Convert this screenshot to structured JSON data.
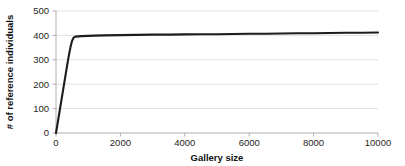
{
  "chart_data": {
    "type": "line",
    "title": "",
    "xlabel": "Gallery size",
    "ylabel": "# of reference individuals",
    "xlim": [
      0,
      10000
    ],
    "ylim": [
      0,
      500
    ],
    "xticks": [
      0,
      2000,
      4000,
      6000,
      8000,
      10000
    ],
    "xtick_labels": [
      "0",
      "2000",
      "4000",
      "6000",
      "8000",
      "10000"
    ],
    "yticks": [
      0,
      100,
      200,
      300,
      400,
      500
    ],
    "ytick_labels": [
      "0",
      "100",
      "200",
      "300",
      "400",
      "500"
    ],
    "grid": "horizontal",
    "legend": "none",
    "line_color": "#1c1c1c",
    "grid_color": "#d9d9d9",
    "axis_color": "#a6a6a6",
    "background_color": "#ffffff",
    "series": [
      {
        "name": "reference individuals",
        "x": [
          0,
          50,
          100,
          150,
          200,
          250,
          300,
          350,
          400,
          450,
          500,
          550,
          600,
          700,
          800,
          1000,
          1200,
          1500,
          2000,
          2500,
          3000,
          3500,
          4000,
          4500,
          5000,
          5500,
          6000,
          6500,
          7000,
          7500,
          8000,
          8500,
          9000,
          9500,
          10000
        ],
        "y": [
          0,
          40,
          80,
          120,
          160,
          200,
          240,
          280,
          318,
          352,
          378,
          391,
          395,
          396,
          397,
          398,
          399,
          400,
          401,
          402,
          403,
          403,
          404,
          405,
          405,
          406,
          407,
          407,
          408,
          409,
          409,
          410,
          411,
          411,
          412
        ]
      }
    ],
    "annotations": []
  },
  "axis": {
    "x_title": "Gallery size",
    "y_title": "# of reference individuals"
  }
}
